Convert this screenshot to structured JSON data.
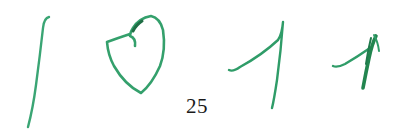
{
  "page": {
    "page_number": "25",
    "background_color": "#ffffff",
    "ink_color": "#2e9e6a",
    "ink_dark_color": "#1f7a4c",
    "text_color": "#1a1a1a"
  },
  "strokes": [
    {
      "name": "handwritten-digit-1",
      "glyph": "1"
    },
    {
      "name": "handwritten-digit-0-heart",
      "glyph": "0"
    },
    {
      "name": "handwritten-digit-7-or-1",
      "glyph": "1"
    },
    {
      "name": "handwritten-digit-small-1",
      "glyph": "1"
    }
  ]
}
